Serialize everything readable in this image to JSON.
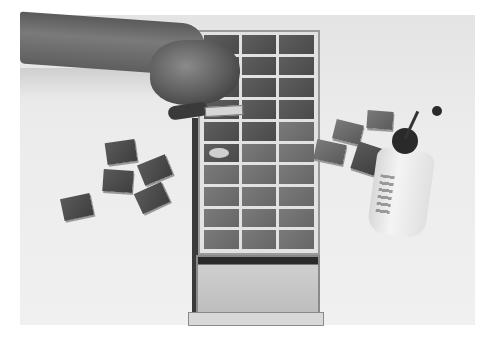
{
  "image": {
    "description": "Black-and-white photograph of a hand placing a square tile into a long wooden tray with a grid of tiles and a pull-out drawer; loose tiles on the table at left and right, and a glue bottle with a nozzle at right.",
    "colors": {
      "background": "#ffffff",
      "table": "#ececec",
      "tile": "#505050",
      "tray_frame": "#e2e2e2",
      "shadow": "#2a2a2a"
    },
    "objects": [
      {
        "name": "arm-and-hand",
        "position": "upper left"
      },
      {
        "name": "tile-tray",
        "columns": 3,
        "rows": 10
      },
      {
        "name": "tray-drawer",
        "state": "open"
      },
      {
        "name": "loose-tiles-left",
        "count": 5
      },
      {
        "name": "loose-tiles-right",
        "count": 5
      },
      {
        "name": "glue-bottle",
        "position": "right"
      }
    ]
  }
}
